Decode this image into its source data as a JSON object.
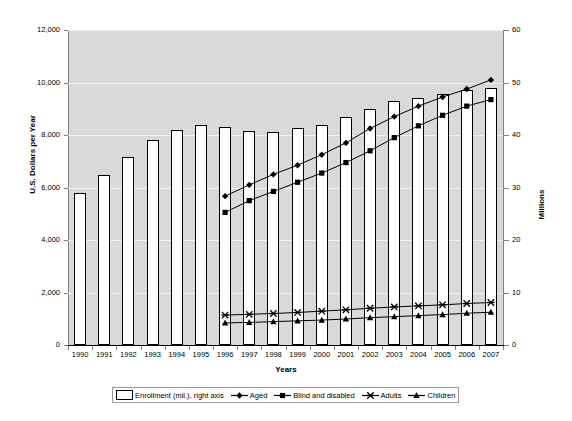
{
  "chart_data": {
    "type": "bar",
    "title": "",
    "subtitle": "",
    "xlabel": "Years",
    "ylabel": "U.S. Dollars per Year",
    "ylabel_right": "Millions",
    "grid": true,
    "legend_position": "bottom",
    "categories": [
      "1990",
      "1991",
      "1992",
      "1993",
      "1994",
      "1995",
      "1996",
      "1997",
      "1998",
      "1999",
      "2000",
      "2001",
      "2002",
      "2003",
      "2004",
      "2005",
      "2006",
      "2007"
    ],
    "ylim": [
      0,
      12000
    ],
    "yticks": [
      "0",
      "2,000",
      "4,000",
      "6,000",
      "8,000",
      "10,000",
      "12,000"
    ],
    "ylim_right": [
      0,
      60
    ],
    "yticks_right": [
      "0",
      "10",
      "20",
      "30",
      "40",
      "50",
      "60"
    ],
    "series": [
      {
        "name": "Enrollment (mil.), right axis",
        "type": "bar",
        "axis": "right",
        "unit": "millions",
        "values": [
          29.0,
          32.3,
          35.8,
          39.0,
          41.0,
          42.0,
          41.5,
          40.7,
          40.5,
          41.3,
          42.0,
          43.5,
          45.0,
          46.4,
          47.0,
          47.8,
          48.5,
          49.0
        ]
      },
      {
        "name": "Aged",
        "type": "line",
        "axis": "left",
        "marker": "diamond",
        "unit": "dollars",
        "values": [
          null,
          null,
          null,
          null,
          null,
          null,
          5670,
          6100,
          6500,
          6850,
          7250,
          7700,
          8250,
          8700,
          9100,
          9450,
          9750,
          10100
        ]
      },
      {
        "name": "Blind and disabled",
        "type": "line",
        "axis": "left",
        "marker": "square",
        "unit": "dollars",
        "values": [
          null,
          null,
          null,
          null,
          null,
          null,
          5050,
          5500,
          5850,
          6200,
          6550,
          6950,
          7400,
          7900,
          8350,
          8750,
          9100,
          9350
        ]
      },
      {
        "name": "Adults",
        "type": "line",
        "axis": "left",
        "marker": "x-star",
        "unit": "dollars",
        "values": [
          null,
          null,
          null,
          null,
          null,
          null,
          1140,
          1170,
          1200,
          1240,
          1290,
          1340,
          1400,
          1450,
          1490,
          1530,
          1580,
          1620
        ]
      },
      {
        "name": "Children",
        "type": "line",
        "axis": "left",
        "marker": "triangle",
        "unit": "dollars",
        "values": [
          null,
          null,
          null,
          null,
          null,
          null,
          840,
          860,
          890,
          920,
          950,
          990,
          1040,
          1080,
          1120,
          1160,
          1210,
          1250
        ]
      }
    ]
  },
  "legend": {
    "items": [
      {
        "label": "Enrollment (mil.), right axis",
        "marker": "bar-swatch"
      },
      {
        "label": "Aged",
        "marker": "diamond-line"
      },
      {
        "label": "Blind and disabled",
        "marker": "square-line"
      },
      {
        "label": "Adults",
        "marker": "x-star-line"
      },
      {
        "label": "Children",
        "marker": "triangle-line"
      }
    ]
  },
  "colors": {
    "plot_background": "#d9d9d9",
    "bar_fill": "#ffffff",
    "bar_stroke": "#000000",
    "line": "#000000",
    "gridline": "#f0f0f0",
    "text": "#000000"
  }
}
